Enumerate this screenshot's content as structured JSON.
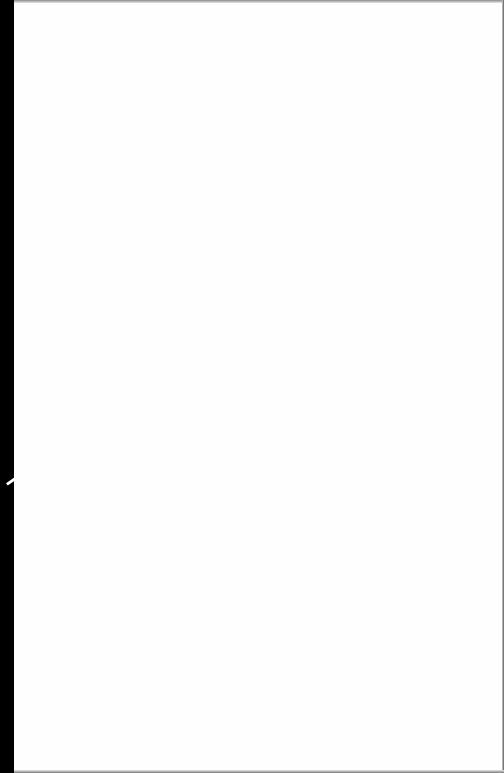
{
  "document": {
    "type": "scanned-page",
    "content": "",
    "colors": {
      "page": "#fefefe",
      "left_margin": "#000000",
      "edges": "#8a8a8a"
    }
  }
}
